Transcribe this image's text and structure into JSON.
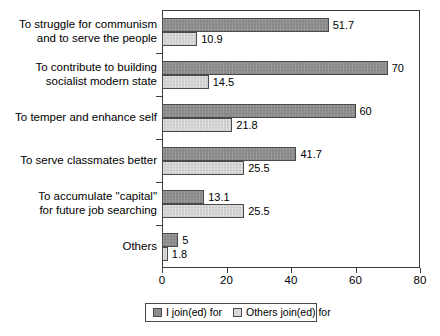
{
  "chart_data": {
    "type": "bar",
    "orientation": "horizontal",
    "title": "",
    "subtitle": "",
    "xlabel": "",
    "ylabel": "",
    "xlim": [
      0,
      80
    ],
    "xticks": [
      0,
      20,
      40,
      60,
      80
    ],
    "grid": false,
    "legend_position": "bottom",
    "categories": [
      "To struggle for communism\nand to serve the people",
      "To contribute to building\nsocialist modern state",
      "To temper and enhance self",
      "To serve classmates better",
      "To accumulate \"capital\"\nfor future job searching",
      "Others"
    ],
    "series": [
      {
        "name": "I join(ed) for",
        "color": "#8d8d8d",
        "values": [
          51.7,
          70,
          60,
          41.7,
          13.1,
          5
        ],
        "labels": [
          "51.7",
          "70",
          "60",
          "41.7",
          "13.1",
          "5"
        ]
      },
      {
        "name": "Others join(ed) for",
        "color": "#d2d2d2",
        "values": [
          10.9,
          14.5,
          21.8,
          25.5,
          25.5,
          1.8
        ],
        "labels": [
          "10.9",
          "14.5",
          "21.8",
          "25.5",
          "25.5",
          "1.8"
        ]
      }
    ]
  },
  "legend": {
    "entries": [
      {
        "label": "I join(ed) for"
      },
      {
        "label": "Others join(ed) for"
      }
    ]
  },
  "axis": {
    "x_tick_labels": [
      "0",
      "20",
      "40",
      "60",
      "80"
    ]
  }
}
